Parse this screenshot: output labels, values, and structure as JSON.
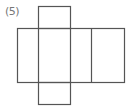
{
  "label": "(5)",
  "stroke_color": "#555555",
  "net": {
    "top_square": {
      "x": 38,
      "y": 6,
      "w": 32,
      "h": 22
    },
    "main_rect": {
      "x": 17,
      "y": 28,
      "w": 107,
      "h": 54
    },
    "vertical_dividers": [
      38,
      70,
      91
    ],
    "bottom_square": {
      "x": 38,
      "y": 82,
      "w": 32,
      "h": 22
    }
  }
}
